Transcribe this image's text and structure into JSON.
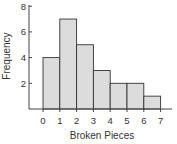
{
  "chart_data": {
    "type": "bar",
    "subtype": "histogram",
    "title": "",
    "xlabel": "Broken Pieces",
    "ylabel": "Frequency",
    "bin_edges": [
      0,
      1,
      2,
      3,
      4,
      5,
      6,
      7
    ],
    "categories": [
      "0-1",
      "1-2",
      "2-3",
      "3-4",
      "4-5",
      "5-6",
      "6-7"
    ],
    "values": [
      4,
      7,
      5,
      3,
      2,
      2,
      1
    ],
    "x_ticks": [
      "0",
      "1",
      "2",
      "3",
      "4",
      "5",
      "6",
      "7"
    ],
    "y_ticks": [
      "2",
      "4",
      "6",
      "8"
    ],
    "ylim": [
      0,
      8.4
    ],
    "xlim": [
      -0.8,
      7.7
    ],
    "grid": false,
    "legend": null,
    "bar_color": "#dcdcdc",
    "edge_color": "#333333"
  }
}
